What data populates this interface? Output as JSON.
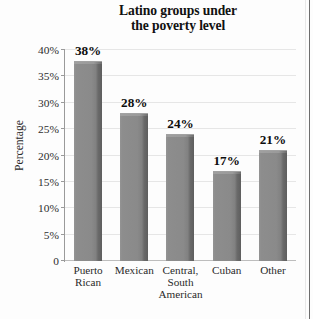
{
  "chart_data": {
    "type": "bar",
    "title": "Latino groups under the poverty level",
    "title_lines": [
      "Latino groups under",
      "the poverty level"
    ],
    "xlabel": "",
    "ylabel": "Percentage",
    "categories": [
      "Puerto Rican",
      "Mexican",
      "Central, South American",
      "Cuban",
      "Other"
    ],
    "category_lines": [
      [
        "Puerto",
        "Rican"
      ],
      [
        "Mexican"
      ],
      [
        "Central,",
        "South",
        "American"
      ],
      [
        "Cuban"
      ],
      [
        "Other"
      ]
    ],
    "values": [
      38,
      28,
      24,
      17,
      21
    ],
    "value_labels": [
      "38%",
      "28%",
      "24%",
      "17%",
      "21%"
    ],
    "ylim": [
      0,
      40
    ],
    "yticks": [
      0,
      5,
      10,
      15,
      20,
      25,
      30,
      35,
      40
    ],
    "ytick_labels": [
      "0",
      "5%",
      "10%",
      "15%",
      "20%",
      "25%",
      "30%",
      "35%",
      "40%"
    ],
    "grid": true,
    "legend": "none",
    "colors": {
      "bar_fill": "#8a8a8a",
      "bar_shadow": "#5e5e5e",
      "gridline": "#e6e6e6",
      "axis": "#9a9a9a",
      "text": "#2a2a2a",
      "background": "#fdfdfd"
    }
  }
}
